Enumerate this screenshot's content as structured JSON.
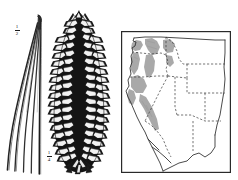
{
  "plate": {
    "title": "Botanical plate: pine needles, cone, and western North American range map",
    "background_color": "#ffffff",
    "ink_color": "#1a1a1a"
  },
  "figures": [
    {
      "name": "needle-fascicle",
      "description": "Bundle of five long slender curved pine needles",
      "scale_label": {
        "numerator": "1",
        "denominator": "2"
      }
    },
    {
      "name": "pine-cone",
      "description": "Elongated cylindrical pine cone with reflexed scales",
      "scale_label": {
        "numerator": "1",
        "denominator": "4"
      }
    }
  ],
  "map": {
    "name": "western-united-states-range-map",
    "frame_color": "#2a2a2a",
    "land_color": "#ffffff",
    "range_shading_color": "#a8a8a8",
    "state_border_style": "dashed",
    "coast_border_style": "solid",
    "regions_shaded": [
      "Washington Cascades",
      "Olympic Peninsula",
      "Oregon Cascades",
      "Northern Idaho",
      "Northern California Coast Ranges",
      "Sierra Nevada"
    ]
  }
}
